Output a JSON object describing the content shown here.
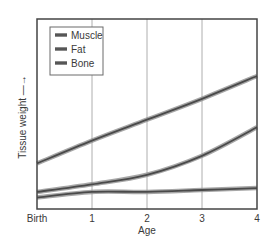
{
  "chart_data": {
    "type": "line",
    "title": "",
    "xlabel": "Age",
    "ylabel": "Tissue weight",
    "ylabel_arrow": "→",
    "x": [
      0,
      1,
      2,
      3,
      4
    ],
    "categories": [
      "Birth",
      "1",
      "2",
      "3",
      "4"
    ],
    "ylim": [
      0,
      100
    ],
    "yticks_shown": false,
    "grid": {
      "vertical": true,
      "horizontal": false
    },
    "legend": {
      "position": "upper-left",
      "entries": [
        "Muscle",
        "Fat",
        "Bone"
      ]
    },
    "series": [
      {
        "name": "Muscle",
        "values": [
          24,
          36,
          47,
          58,
          70
        ]
      },
      {
        "name": "Fat",
        "values": [
          9,
          13,
          18,
          28,
          43
        ]
      },
      {
        "name": "Bone",
        "values": [
          6,
          9,
          9,
          10,
          11
        ]
      }
    ]
  },
  "colors": {
    "line_outer": "#8a8a8a",
    "line_inner": "#4a4a4a",
    "frame": "#444444",
    "grid": "#9a9a9a",
    "background": "#ffffff"
  },
  "legend_labels": [
    "Muscle",
    "Fat",
    "Bone"
  ],
  "x_tick_labels": [
    "Birth",
    "1",
    "2",
    "3",
    "4"
  ],
  "x_axis_label": "Age",
  "y_axis_label": "Tissue weight —→"
}
